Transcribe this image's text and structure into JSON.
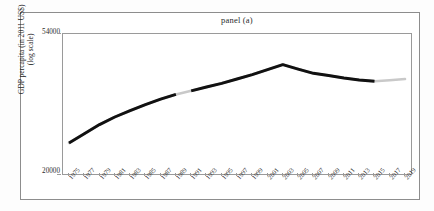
{
  "figure": {
    "panel_title": "panel (a)"
  },
  "chart_data": {
    "type": "line",
    "title": "panel (a)",
    "xlabel": "",
    "ylabel": "GDP percapita (in 2011 US$)",
    "ylabel_line2": "(log scale)",
    "yscale": "log",
    "ylim": [
      20000,
      54000
    ],
    "ytick_labels": [
      "54000",
      "20000"
    ],
    "ytick_values": [
      54000,
      20000
    ],
    "grid": false,
    "legend": "none",
    "xtick_labels": [
      "1975",
      "1977",
      "1979",
      "1981",
      "1983",
      "1985",
      "1987",
      "1989",
      "1991",
      "1993",
      "1995",
      "1997",
      "1999",
      "2001",
      "2003",
      "2005",
      "2007",
      "2009",
      "2011",
      "2013",
      "2015",
      "2017",
      "2019"
    ],
    "x": [
      1975,
      1977,
      1979,
      1981,
      1983,
      1985,
      1987,
      1989,
      1991,
      1993,
      1995,
      1997,
      1999,
      2001,
      2003,
      2005,
      2007,
      2009,
      2011,
      2013,
      2015,
      2017,
      2019
    ],
    "series": [
      {
        "name": "GDP per capita",
        "color": "#111111",
        "values": [
          24300,
          26100,
          28000,
          29700,
          31200,
          32700,
          34100,
          35400,
          36400,
          37500,
          38600,
          39900,
          41300,
          42900,
          44600,
          43100,
          41700,
          41000,
          40200,
          39600,
          39200,
          39500,
          39900
        ]
      }
    ],
    "annotations": [
      {
        "label": "peak",
        "x": 2003,
        "y": 44600
      },
      {
        "label": "line-break",
        "x": 1989
      }
    ]
  },
  "colors": {
    "line": "#111111",
    "ghost_line": "#c9c9c9",
    "frame": "#9a9a9a",
    "outer_frame": "#8d8d8d",
    "text": "#2b2b2b",
    "background": "#ffffff"
  }
}
